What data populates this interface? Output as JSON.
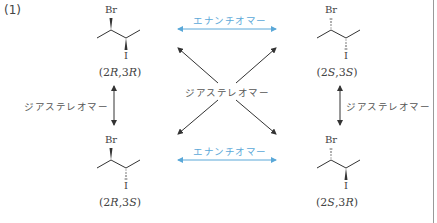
{
  "problem_label": "(1)",
  "molecules": [
    {
      "id": "top-left",
      "config_prefix": "(2",
      "c2": "R",
      "mid": ",3",
      "c3": "R",
      "suffix": ")",
      "label": "(2R,3R)",
      "br": "Br",
      "i": "I",
      "br_bond": "wedge",
      "i_bond": "wedge"
    },
    {
      "id": "top-right",
      "config_prefix": "(2",
      "c2": "S",
      "mid": ",3",
      "c3": "S",
      "suffix": ")",
      "label": "(2S,3S)",
      "br": "Br",
      "i": "I",
      "br_bond": "hash",
      "i_bond": "hash"
    },
    {
      "id": "bottom-left",
      "config_prefix": "(2",
      "c2": "R",
      "mid": ",3",
      "c3": "S",
      "suffix": ")",
      "label": "(2R,3S)",
      "br": "Br",
      "i": "I",
      "br_bond": "wedge",
      "i_bond": "hash"
    },
    {
      "id": "bottom-right",
      "config_prefix": "(2",
      "c2": "S",
      "mid": ",3",
      "c3": "R",
      "suffix": ")",
      "label": "(2S,3R)",
      "br": "Br",
      "i": "I",
      "br_bond": "hash",
      "i_bond": "wedge"
    }
  ],
  "relations": {
    "enantiomer_top": "エナンチオマー",
    "enantiomer_bottom": "エナンチオマー",
    "diastereomer_center": "ジアステレオマー",
    "diastereomer_left": "ジアステレオマー",
    "diastereomer_right": "ジアステレオマー"
  },
  "colors": {
    "enantiomer_arrow": "#5aa8d8",
    "diastereomer_arrow": "#333333",
    "text": "#444444"
  }
}
